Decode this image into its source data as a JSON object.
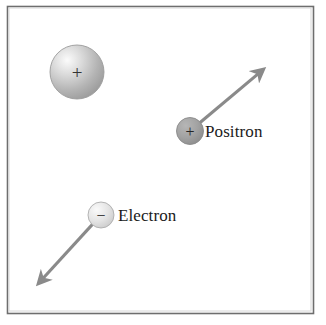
{
  "figure": {
    "background_color": "#ffffff",
    "frame_color": "#6e6e6e",
    "arrow_color": "#8a8a8a",
    "width": 326,
    "height": 325
  },
  "particles": [
    {
      "id": "large-positive-sphere",
      "charge_symbol": "+",
      "label": "",
      "fill_light": "#f2f2f2",
      "fill_dark": "#9a9a9a",
      "cx": 77,
      "cy": 72,
      "r": 27,
      "has_arrow": false
    },
    {
      "id": "positron",
      "charge_symbol": "+",
      "label": "Positron",
      "fill_light": "#a8a8a8",
      "fill_dark": "#8d8d8d",
      "cx": 190,
      "cy": 131,
      "r": 13.5,
      "has_arrow": true,
      "arrow_tip_x": 265,
      "arrow_tip_y": 68,
      "label_x": 205,
      "label_y": 137
    },
    {
      "id": "electron",
      "charge_symbol": "−",
      "label": "Electron",
      "fill_light": "#f4f4f4",
      "fill_dark": "#cfcfcf",
      "cx": 101,
      "cy": 215,
      "r": 13,
      "has_arrow": true,
      "arrow_tip_x": 37,
      "arrow_tip_y": 285,
      "label_x": 118,
      "label_y": 221
    }
  ],
  "labels": {
    "positron": "Positron",
    "electron": "Electron",
    "positive_charge": "+",
    "negative_charge": "−"
  },
  "frame": {
    "x": 7,
    "y": 6,
    "width": 306,
    "height": 307
  }
}
